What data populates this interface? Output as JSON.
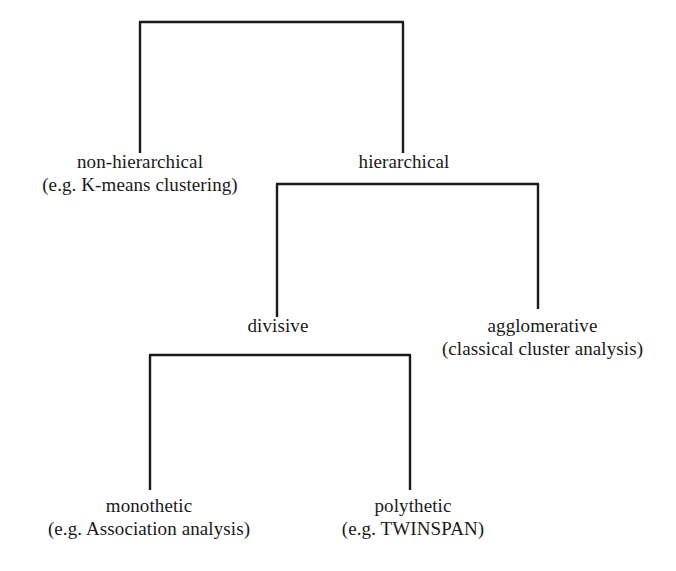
{
  "diagram": {
    "type": "tree",
    "orientation": "top-down",
    "background_color": "#ffffff",
    "line_color": "#1a1a1a",
    "text_color": "#1a1a1a",
    "nodes": [
      {
        "id": "root",
        "title": "",
        "example": "",
        "level": 0
      },
      {
        "id": "non-hierarchical",
        "title": "non-hierarchical",
        "example": "(e.g. K-means clustering)",
        "level": 1
      },
      {
        "id": "hierarchical",
        "title": "hierarchical",
        "example": "",
        "level": 1
      },
      {
        "id": "divisive",
        "title": "divisive",
        "example": "",
        "level": 2
      },
      {
        "id": "agglomerative",
        "title": "agglomerative",
        "example": "(classical cluster analysis)",
        "level": 2
      },
      {
        "id": "monothetic",
        "title": "monothetic",
        "example": "(e.g. Association analysis)",
        "level": 3
      },
      {
        "id": "polythetic",
        "title": "polythetic",
        "example": "(e.g. TWINSPAN)",
        "level": 3
      }
    ],
    "edges": [
      {
        "from": "root",
        "to": "non-hierarchical"
      },
      {
        "from": "root",
        "to": "hierarchical"
      },
      {
        "from": "hierarchical",
        "to": "divisive"
      },
      {
        "from": "hierarchical",
        "to": "agglomerative"
      },
      {
        "from": "divisive",
        "to": "monothetic"
      },
      {
        "from": "divisive",
        "to": "polythetic"
      }
    ]
  },
  "labels": {
    "non_hierarchical": {
      "title": "non-hierarchical",
      "example": "(e.g. K-means clustering)"
    },
    "hierarchical": {
      "title": "hierarchical",
      "example": ""
    },
    "divisive": {
      "title": "divisive",
      "example": ""
    },
    "agglomerative": {
      "title": "agglomerative",
      "example": "(classical cluster analysis)"
    },
    "monothetic": {
      "title": "monothetic",
      "example": "(e.g. Association analysis)"
    },
    "polythetic": {
      "title": "polythetic",
      "example": "(e.g. TWINSPAN)"
    }
  }
}
